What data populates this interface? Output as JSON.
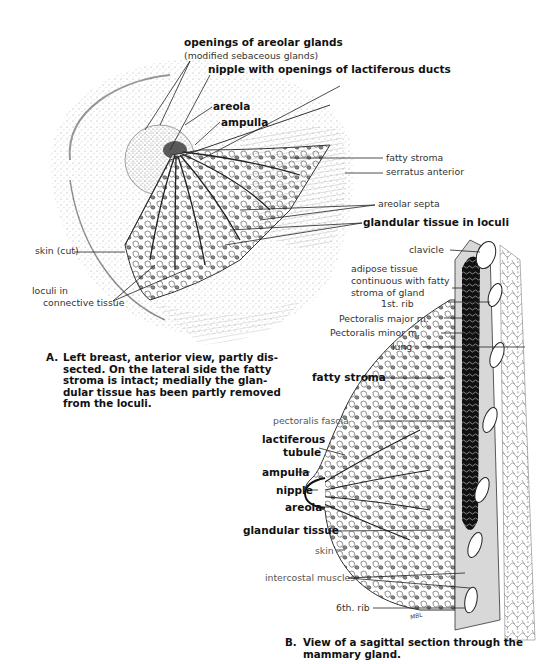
{
  "figure_a": {
    "labels": {
      "openings_areolar_glands": "openings of areolar glands",
      "modified_sebaceous": "(modified sebaceous glands)",
      "nipple_openings": "nipple with openings of lactiferous ducts",
      "areola": "areola",
      "ampulla": "ampulla",
      "fatty_stroma": "fatty stroma",
      "serratus_anterior": "serratus anterior",
      "areolar_septa": "areolar septa",
      "glandular_tissue_loculi": "glandular tissue in loculi",
      "skin_cut": "skin (cut)",
      "loculi_in": "loculi in",
      "connective_tissue": "connective tissue"
    },
    "caption": {
      "letter": "A.",
      "text": "Left breast, anterior view, partly dis-\nsected. On the lateral side the fatty\nstroma is intact; medially the glan-\ndular tissue has been partly removed\nfrom the loculi."
    }
  },
  "figure_b": {
    "labels": {
      "clavicle": "clavicle",
      "adipose_1": "adipose tissue",
      "adipose_2": "continuous with fatty",
      "adipose_3": "stroma of gland",
      "first_rib": "1st. rib",
      "pectoralis_major": "Pectoralis major m.",
      "pectoralis_minor": "Pectoralis minor m.",
      "lung": "lung",
      "fatty_stroma": "fatty stroma",
      "pectoralis_fascia": "pectoralis fascia",
      "lactiferous": "lactiferous",
      "tubule": "tubule",
      "ampulla": "ampulla",
      "nipple": "nipple",
      "areola": "areola",
      "glandular_tissue": "glandular tissue",
      "skin": "skin",
      "intercostal_muscles": "intercostal muscles",
      "sixth_rib": "6th. rib"
    },
    "caption": {
      "letter": "B.",
      "text": "View of a sagittal section through the\nmammary gland."
    },
    "signature": "MBL"
  }
}
